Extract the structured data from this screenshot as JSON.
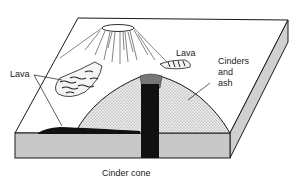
{
  "diagram": {
    "caption": "Cinder cone",
    "labels": {
      "lava_left": "Lava",
      "lava_top": "Lava",
      "cinders_line1": "Cinders",
      "cinders_line2": "and",
      "cinders_line3": "ash"
    },
    "colors": {
      "outline": "#1a1a1a",
      "block_face": "#c8c8c8",
      "cone_fill": "#e2e2e2",
      "conduit": "#111111",
      "background": "#ffffff"
    }
  }
}
